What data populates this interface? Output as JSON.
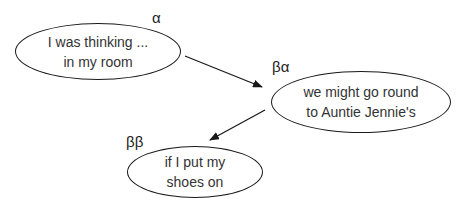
{
  "nodes": [
    {
      "id": "alpha",
      "label": "α",
      "lines": [
        "I was thinking ...",
        "in my room"
      ]
    },
    {
      "id": "beta-alpha",
      "label": "βα",
      "lines": [
        "we might go round",
        "to Auntie Jennie's"
      ]
    },
    {
      "id": "beta-beta",
      "label": "ββ",
      "lines": [
        "if I put my",
        "shoes on"
      ]
    }
  ],
  "edges": [
    {
      "from": "alpha",
      "to": "beta-alpha"
    },
    {
      "from": "beta-alpha",
      "to": "beta-beta"
    }
  ],
  "colors": {
    "stroke": "#1a1a1a",
    "text": "#333333",
    "background": "#ffffff"
  }
}
